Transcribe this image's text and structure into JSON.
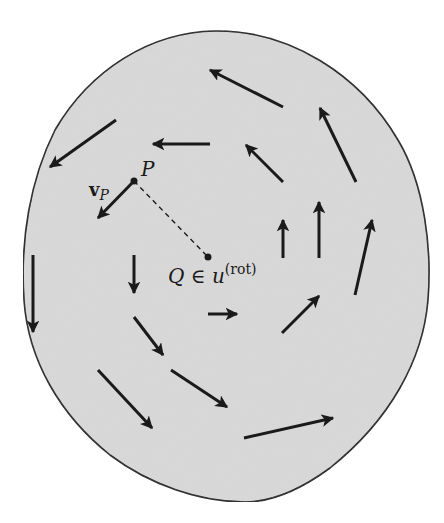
{
  "figure": {
    "colors": {
      "body_fill": "#d9d9d9",
      "outline": "#1a1a1a",
      "arrow": "#1a1a1a",
      "background": "#ffffff"
    },
    "labels": {
      "point_p": "P",
      "velocity_p_bold": "v",
      "velocity_p_sub": "P",
      "point_q_text": "Q ∈ u",
      "point_q_sup": "(rot)"
    },
    "points": {
      "P": {
        "x": 134,
        "y": 181
      },
      "Q": {
        "x": 208,
        "y": 257
      }
    },
    "arrows": [
      {
        "id": "arrow-1",
        "from": [
          283,
          107
        ],
        "to": [
          210,
          70
        ]
      },
      {
        "id": "arrow-2",
        "from": [
          356,
          182
        ],
        "to": [
          320,
          108
        ]
      },
      {
        "id": "arrow-3",
        "from": [
          210,
          144
        ],
        "to": [
          153,
          144
        ]
      },
      {
        "id": "arrow-4",
        "from": [
          283,
          182
        ],
        "to": [
          246,
          145
        ]
      },
      {
        "id": "arrow-5",
        "from": [
          116,
          120
        ],
        "to": [
          50,
          167
        ]
      },
      {
        "id": "velocity-p",
        "from": [
          134,
          181
        ],
        "to": [
          98,
          218
        ]
      },
      {
        "id": "arrow-7",
        "from": [
          283,
          258
        ],
        "to": [
          283,
          220
        ]
      },
      {
        "id": "arrow-8",
        "from": [
          319,
          258
        ],
        "to": [
          319,
          202
        ]
      },
      {
        "id": "arrow-9",
        "from": [
          355,
          295
        ],
        "to": [
          372,
          220
        ]
      },
      {
        "id": "arrow-10",
        "from": [
          33,
          255
        ],
        "to": [
          33,
          332
        ]
      },
      {
        "id": "arrow-11",
        "from": [
          134,
          255
        ],
        "to": [
          134,
          293
        ]
      },
      {
        "id": "arrow-12",
        "from": [
          208,
          314
        ],
        "to": [
          237,
          314
        ]
      },
      {
        "id": "arrow-13",
        "from": [
          282,
          333
        ],
        "to": [
          319,
          296
        ]
      },
      {
        "id": "arrow-14",
        "from": [
          134,
          317
        ],
        "to": [
          163,
          355
        ]
      },
      {
        "id": "arrow-15",
        "from": [
          98,
          370
        ],
        "to": [
          152,
          428
        ]
      },
      {
        "id": "arrow-16",
        "from": [
          171,
          370
        ],
        "to": [
          227,
          407
        ]
      },
      {
        "id": "arrow-17",
        "from": [
          244,
          438
        ],
        "to": [
          333,
          418
        ]
      }
    ]
  }
}
